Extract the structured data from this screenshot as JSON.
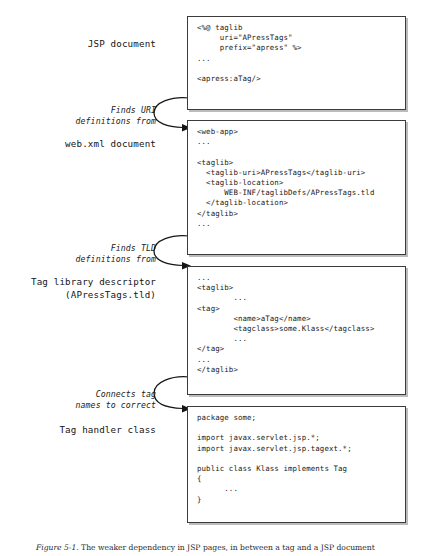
{
  "figure": {
    "caption_label": "Figure 5-1.",
    "caption_text": "The weaker dependency in JSP pages, in between a tag and a JSP document"
  },
  "labels": {
    "jsp_document": "JSP document",
    "web_xml_document": "web.xml document",
    "tag_library_descriptor": "Tag library descriptor\n(APressTags.tld)",
    "tag_handler_class": "Tag handler class"
  },
  "annotations": {
    "finds_uri": "Finds URI\ndefinitions from",
    "finds_tld": "Finds TLD\ndefinitions from",
    "connects_tag": "Connects tag\nnames to correct"
  },
  "code_boxes": {
    "jsp_document": "<%@ taglib\n     uri=\"APressTags\"\n     prefix=\"apress\" %>\n...\n\n<apress:aTag/>",
    "web_xml": "<web-app>\n...\n\n<taglib>\n  <taglib-uri>APressTags</taglib-uri>\n  <taglib-location>\n      WEB-INF/taglibDefs/APressTags.tld\n  </taglib-location>\n</taglib>\n...",
    "tld": "...\n<taglib>\n        ...\n<tag>\n        <name>aTag</name>\n        <tagclass>some.Klass</tagclass>\n        ...\n</tag>\n...\n</taglib>",
    "tag_handler": "package some;\n\nimport javax.servlet.jsp.*;\nimport javax.servlet.jsp.tagext.*;\n\npublic class Klass implements Tag\n{\n      ...\n}"
  },
  "colors": {
    "box_border": "#3b3b3b",
    "box_shadow": "#bcbcbc",
    "arrow": "#161616",
    "text": "#1a1a1a",
    "background": "#ffffff"
  }
}
